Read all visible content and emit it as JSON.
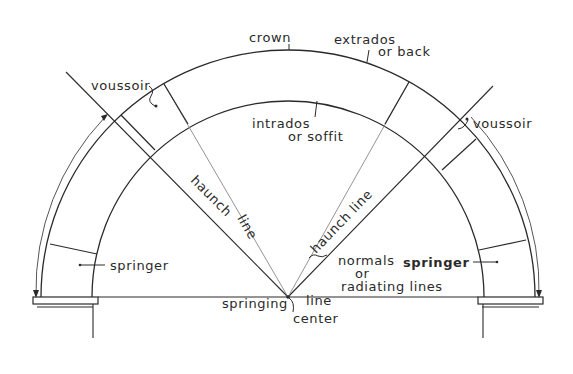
{
  "diagram": {
    "labels": {
      "crown": "crown",
      "extrados_line1": "extrados",
      "extrados_line2": "or back",
      "intrados_line1": "intrados",
      "intrados_line2": "or soffit",
      "voussoir_left": "voussoir",
      "voussoir_right": "voussoir",
      "haunch_left_word1": "haunch",
      "haunch_left_word2": "line",
      "haunch_right": "haunch line",
      "springer_left": "springer",
      "springer_right": "springer",
      "normals_line1": "normals",
      "normals_line2": "or",
      "normals_line3": "radiating lines",
      "springing": "springing",
      "springing_line": "line",
      "center": "center"
    },
    "geometry": {
      "center": [
        288,
        297
      ],
      "extrados_radius": 247,
      "intrados_radius": 196,
      "stroke_color": "#2a2a2a"
    }
  }
}
